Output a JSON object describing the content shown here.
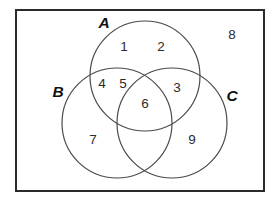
{
  "figure": {
    "kind": "venn-diagram",
    "set_count": 3,
    "universe_border_color": "#2b2b2b",
    "circle_stroke_color": "#4a4a4a",
    "background_color": "#ffffff"
  },
  "sets": [
    {
      "id": "A",
      "label": "A",
      "label_x": 104,
      "label_y": 24,
      "cx": 145,
      "cy": 76,
      "r": 55
    },
    {
      "id": "B",
      "label": "B",
      "label_x": 58,
      "label_y": 93,
      "cx": 117,
      "cy": 123,
      "r": 55
    },
    {
      "id": "C",
      "label": "C",
      "label_x": 232,
      "label_y": 97,
      "cx": 172,
      "cy": 123,
      "r": 55
    }
  ],
  "regions": [
    {
      "name": "A-only-left",
      "value": "1",
      "x": 124,
      "y": 47
    },
    {
      "name": "A-only-right",
      "value": "2",
      "x": 161,
      "y": 47
    },
    {
      "name": "A-and-B-outer",
      "value": "4",
      "x": 102,
      "y": 84
    },
    {
      "name": "A-and-B-inner",
      "value": "5",
      "x": 123,
      "y": 84
    },
    {
      "name": "A-and-C",
      "value": "3",
      "x": 177,
      "y": 88
    },
    {
      "name": "A-and-B-and-C",
      "value": "6",
      "x": 145,
      "y": 104
    },
    {
      "name": "B-only",
      "value": "7",
      "x": 93,
      "y": 140
    },
    {
      "name": "C-only",
      "value": "9",
      "x": 192,
      "y": 140
    },
    {
      "name": "outside-all-sets",
      "value": "8",
      "x": 232,
      "y": 35
    }
  ],
  "universe": {
    "x": 16,
    "y": 10,
    "width": 248,
    "height": 181
  }
}
